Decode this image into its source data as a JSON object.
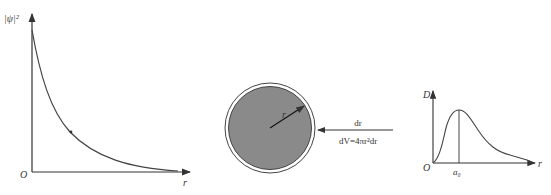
{
  "panels": {
    "probability_density": {
      "y_label": "|ψ|²",
      "x_label": "r",
      "origin_label": "O",
      "curve": "exponential decay"
    },
    "shell": {
      "radius_label": "r",
      "shell_label": "dr",
      "volume_formula": "dV=4πr²dr",
      "fill_color": "#8a8a8a"
    },
    "radial_distribution": {
      "y_label": "D",
      "x_label": "r",
      "origin_label": "O",
      "peak_label": "a₀"
    }
  }
}
